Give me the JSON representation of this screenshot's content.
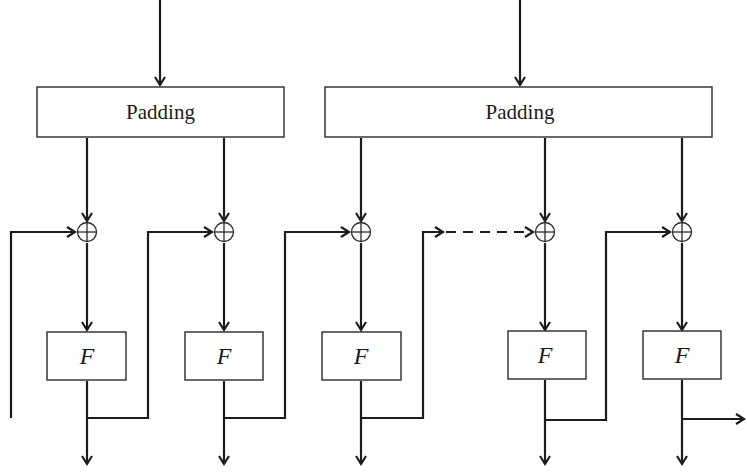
{
  "diagram": {
    "type": "block-cipher-chain",
    "padding_boxes": [
      {
        "label": "Padding",
        "x": 37,
        "y": 87,
        "w": 247,
        "h": 50,
        "input_x": 160
      },
      {
        "label": "Padding",
        "x": 325,
        "y": 87,
        "w": 387,
        "h": 50,
        "input_x": 520
      }
    ],
    "stages": [
      {
        "label": "F",
        "col_x": 87,
        "box_x": 47,
        "feedback_from": "left-edge"
      },
      {
        "label": "F",
        "col_x": 224,
        "box_x": 185,
        "feedback_from": "stage-1"
      },
      {
        "label": "F",
        "col_x": 361,
        "box_x": 322,
        "feedback_from": "stage-2"
      },
      {
        "label": "F",
        "col_x": 545,
        "box_x": 508,
        "feedback_from": "dashed-continuation"
      },
      {
        "label": "F",
        "col_x": 682,
        "box_x": 643,
        "feedback_from": "stage-4"
      }
    ],
    "xor_symbol": "⊕",
    "final_output": "arrow-right",
    "colors": {
      "stroke": "#1c1c1c",
      "background": "#ffffff"
    }
  }
}
